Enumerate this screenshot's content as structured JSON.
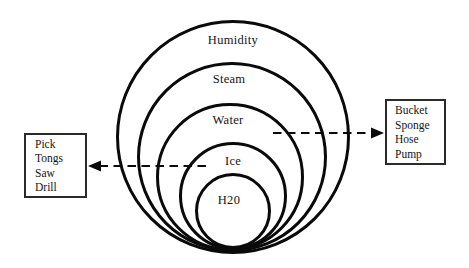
{
  "diagram": {
    "title": "",
    "type": "nested-circles",
    "rings": [
      {
        "label": "Humidity"
      },
      {
        "label": "Steam"
      },
      {
        "label": "Water"
      },
      {
        "label": "Ice"
      },
      {
        "label": "H20"
      }
    ],
    "left_box": {
      "items": [
        "Pick",
        "Tongs",
        "Saw",
        "Drill"
      ]
    },
    "right_box": {
      "items": [
        "Bucket",
        "Sponge",
        "Hose",
        "Pump"
      ]
    },
    "arrows": [
      {
        "name": "left-arrow",
        "style": "dashed",
        "direction": "left",
        "from": "Ice ring",
        "to": "left box"
      },
      {
        "name": "right-arrow",
        "style": "dashed",
        "direction": "right",
        "from": "Water ring",
        "to": "right box"
      }
    ],
    "colors": {
      "stroke": "#0a0a0a",
      "background": "#ffffff",
      "text": "#151515"
    }
  }
}
